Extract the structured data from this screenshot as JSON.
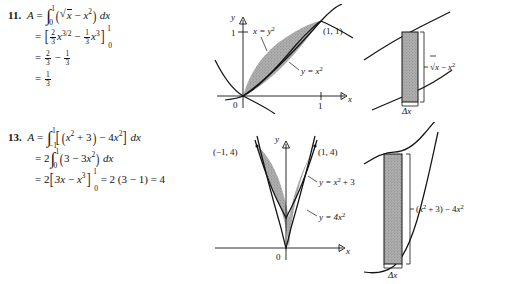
{
  "document": {
    "type": "calculus-solutions-manual-page",
    "background_color": "#ffffff",
    "text_color": "#141414",
    "shading_color": "#a8a8a8"
  },
  "problems": [
    {
      "number": "11.",
      "lines": [
        "A = ∫₀¹ (√x − x²) dx",
        "= [⅔x³ᐟ² − ⅓x³]₀¹",
        "= ⅔ − ⅓",
        "= ⅓"
      ],
      "parts": {
        "lhs": "A",
        "equals": "=",
        "integral_lower": "0",
        "integral_upper": "1",
        "integrand_open": "(",
        "integrand_radicand": "x",
        "integrand_minus": "−",
        "integrand_term2_base": "x",
        "integrand_term2_exp": "2",
        "integrand_close": ")",
        "differential": "dx",
        "antideriv_open": "[",
        "antideriv_f1_num": "2",
        "antideriv_f1_den": "3",
        "antideriv_t1_base": "x",
        "antideriv_t1_exp": "3/2",
        "antideriv_minus": "−",
        "antideriv_f2_num": "1",
        "antideriv_f2_den": "3",
        "antideriv_t2_base": "x",
        "antideriv_t2_exp": "3",
        "antideriv_close": "]",
        "eval_lo": "0",
        "eval_hi": "1",
        "result_a_num": "2",
        "result_a_den": "3",
        "result_minus": "−",
        "result_b_num": "1",
        "result_b_den": "3",
        "final_num": "1",
        "final_den": "3"
      },
      "figure_graph": {
        "y_axis_label": "y",
        "x_axis_label": "x",
        "origin_label": "0",
        "y_tick_label": "1",
        "x_tick_label": "1",
        "curve_label_upper": "x = y",
        "curve_label_upper_exp": "2",
        "curve_label_lower": "y = x",
        "curve_label_lower_exp": "2",
        "point_label": "(1, 1)"
      },
      "figure_strip": {
        "height_label_radicand": "x",
        "height_label_minus": "−",
        "height_label_term_base": "x",
        "height_label_term_exp": "2",
        "width_label": "Δx"
      }
    },
    {
      "number": "13.",
      "lines": [
        "A = ∫₋₁¹ [(x² + 3) − 4x²] dx",
        "= 2∫₀¹ (3 − 3x²) dx",
        "= 2[3x − x³]₀¹ = 2 (3 − 1) = 4"
      ],
      "parts": {
        "lhs": "A",
        "equals": "=",
        "integral_lower": "−1",
        "integral_upper": "1",
        "bracket_open": "[",
        "t1_open": "(",
        "t1_base": "x",
        "t1_exp": "2",
        "t1_plus": "+",
        "t1_const": "3",
        "t1_close": ")",
        "t_minus": "−",
        "t2_coef": "4",
        "t2_base": "x",
        "t2_exp": "2",
        "bracket_close": "]",
        "differential": "dx",
        "line2_coef": "2",
        "line2_lower": "0",
        "line2_upper": "1",
        "line2_open": "(",
        "line2_const": "3",
        "line2_minus": "−",
        "line2_coef2": "3",
        "line2_base": "x",
        "line2_exp": "2",
        "line2_close": ")",
        "line2_diff": "dx",
        "line3_coef": "2",
        "line3_open": "[",
        "line3_t1": "3x",
        "line3_minus": "−",
        "line3_t2_base": "x",
        "line3_t2_exp": "3",
        "line3_close": "]",
        "line3_lo": "0",
        "line3_hi": "1",
        "line3_eq": "=",
        "line3_val": "2 (3 − 1)",
        "line3_eq2": "=",
        "line3_final": "4"
      },
      "figure_graph": {
        "y_axis_label": "y",
        "x_axis_label": "x",
        "origin_label": "0",
        "point_label_left": "(−1, 4)",
        "point_label_right": "(1, 4)",
        "curve_label_upper": "y = x",
        "curve_label_upper_exp": "2",
        "curve_label_upper_tail": "+ 3",
        "curve_label_lower": "y = 4x",
        "curve_label_lower_exp": "2"
      },
      "figure_strip": {
        "height_label_open": "(",
        "height_label_base": "x",
        "height_label_exp": "2",
        "height_label_plus": "+",
        "height_label_const": "3",
        "height_label_close": ")",
        "height_label_minus": "−",
        "height_label_coef": "4",
        "height_label_base2": "x",
        "height_label_exp2": "2",
        "width_label": "Δx"
      }
    }
  ]
}
